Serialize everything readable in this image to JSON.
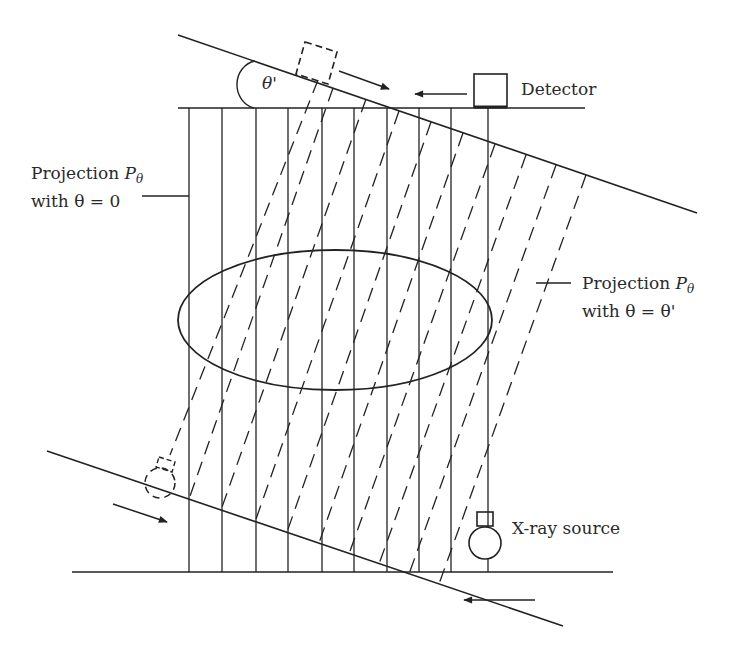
{
  "diagram": {
    "colors": {
      "line": "#222222",
      "background": "#ffffff"
    },
    "labels": {
      "detector": "Detector",
      "xray_source": "X-ray source",
      "angle": "θ'",
      "projection0_line1_text": "Projection ",
      "projection0_line1_sym": "P",
      "projection0_line1_sub": "θ",
      "projection0_line2": "with θ = 0",
      "projection1_line1_text": "Projection ",
      "projection1_line1_sym": "P",
      "projection1_line1_sub": "θ",
      "projection1_line2": "with θ = θ'"
    },
    "geometry": {
      "top_baseline": {
        "x1": 178,
        "y1": 108,
        "x2": 585,
        "y2": 108
      },
      "bottom_baseline": {
        "x1": 72,
        "y1": 572,
        "x2": 613,
        "y2": 572
      },
      "upper_rotated_line": {
        "x1": 178,
        "y1": 35,
        "x2": 697,
        "y2": 213
      },
      "lower_rotated_line": {
        "x1": 47,
        "y1": 451,
        "x2": 563,
        "y2": 626
      },
      "vertical_rays_x": [
        189,
        222,
        256,
        288,
        322,
        354,
        387,
        419,
        451,
        488
      ],
      "object_ellipse": {
        "cx": 335,
        "cy": 320,
        "rx": 157,
        "ry": 70
      },
      "rotated_rays": [
        {
          "x1": 318,
          "y1": 80,
          "x2": 170,
          "y2": 455
        },
        {
          "x1": 333,
          "y1": 88,
          "x2": 189,
          "y2": 499
        },
        {
          "x1": 366,
          "y1": 99,
          "x2": 221,
          "y2": 510
        },
        {
          "x1": 399,
          "y1": 111,
          "x2": 255,
          "y2": 522
        },
        {
          "x1": 431,
          "y1": 122,
          "x2": 287,
          "y2": 532
        },
        {
          "x1": 463,
          "y1": 133,
          "x2": 319,
          "y2": 543
        },
        {
          "x1": 495,
          "y1": 144,
          "x2": 349,
          "y2": 554
        },
        {
          "x1": 526,
          "y1": 155,
          "x2": 379,
          "y2": 564
        },
        {
          "x1": 556,
          "y1": 165,
          "x2": 409,
          "y2": 574
        },
        {
          "x1": 586,
          "y1": 175,
          "x2": 439,
          "y2": 584
        }
      ]
    }
  }
}
